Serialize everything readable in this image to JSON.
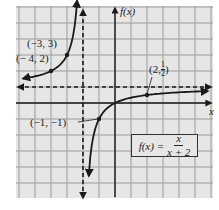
{
  "figure": {
    "function_label": "f(x)",
    "formula": {
      "lhs": "f(x) =",
      "numerator": "x",
      "denominator": "x + 2"
    },
    "axis_labels": {
      "x": "x",
      "y": "f(x)"
    },
    "point_labels": [
      {
        "id": "p1",
        "text": "(−3, 3)"
      },
      {
        "id": "p2",
        "text": "(− 4, 2)"
      },
      {
        "id": "p3",
        "text": "(−1, −1)"
      },
      {
        "id": "p4",
        "prefix": "(2, ",
        "num": "1",
        "den": "2",
        "suffix": ")"
      }
    ]
  },
  "colors": {
    "background": "#e6e6e6",
    "grid": "#9a9a9a",
    "curve": "#1a1a1a",
    "axis": "#1a1a1a"
  },
  "chart_data": {
    "type": "line",
    "function": "x/(x+2)",
    "xlabel": "x",
    "ylabel": "f(x)",
    "xlim": [
      -6,
      6
    ],
    "ylim": [
      -6,
      6
    ],
    "grid": true,
    "asymptotes": {
      "vertical": [
        -2
      ],
      "horizontal": [
        1
      ]
    },
    "points": [
      {
        "x": -4,
        "y": 2,
        "label": "(−4, 2)"
      },
      {
        "x": -3,
        "y": 3,
        "label": "(−3, 3)"
      },
      {
        "x": -1,
        "y": -1,
        "label": "(−1, −1)"
      },
      {
        "x": 2,
        "y": 0.5,
        "label": "(2, 1/2)"
      }
    ],
    "branches": [
      {
        "name": "left branch",
        "x_range": [
          -6,
          -2.4
        ]
      },
      {
        "name": "right branch",
        "x_range": [
          -1.6,
          6
        ]
      }
    ]
  }
}
